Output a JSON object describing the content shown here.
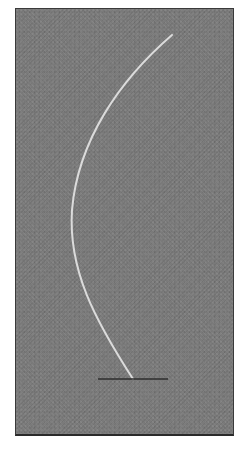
{
  "image": {
    "description": "Grayscale photograph of a thin bright curved filament (arc) on a gray noisy background with a short dark horizontal baseline at its lower end",
    "colors": {
      "background": "#7a7a7a",
      "arc": "#e6e6e6",
      "baseline": "#2e2e2e",
      "border": "#3a3a3a",
      "page": "#ffffff"
    },
    "arc": {
      "start": [
        172,
        35
      ],
      "leftmost": [
        72,
        210
      ],
      "end": [
        133,
        379
      ]
    },
    "baseline": {
      "x1": 98,
      "x2": 168,
      "y": 379
    }
  }
}
